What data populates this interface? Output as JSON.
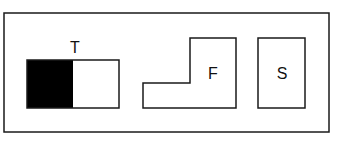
{
  "diagram": {
    "colors": {
      "stroke": "#1a1a1a",
      "fill_dark": "#000000",
      "background": "#ffffff"
    },
    "frame": {
      "x": 4,
      "y": 13,
      "width": 325,
      "height": 119
    },
    "shapes": [
      {
        "id": "T",
        "label": "T",
        "type": "rectangle-split",
        "x": 27,
        "y": 60,
        "width": 92,
        "height": 48,
        "filled_left_width": 46,
        "label_pos": [
          75,
          53
        ]
      },
      {
        "id": "F",
        "label": "F",
        "type": "l-shape",
        "points": "143,83 190,83 190,38 236,38 236,108 143,108",
        "label_pos": [
          213,
          79
        ]
      },
      {
        "id": "S",
        "label": "S",
        "type": "rectangle",
        "x": 258,
        "y": 38,
        "width": 47,
        "height": 70,
        "label_pos": [
          282,
          79
        ]
      }
    ]
  }
}
